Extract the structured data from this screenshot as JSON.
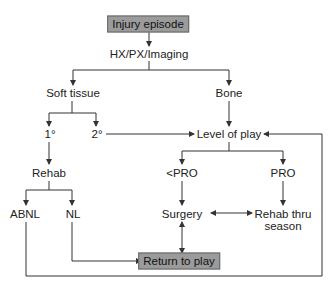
{
  "diagram": {
    "type": "flowchart",
    "colors": {
      "box_fill": "#9b9b9b",
      "box_border": "#666666",
      "line": "#333333",
      "text": "#222222",
      "background": "#ffffff"
    },
    "nodes": {
      "injury_episode": "Injury episode",
      "hx_px_imaging": "HX/PX/Imaging",
      "soft_tissue": "Soft tissue",
      "bone": "Bone",
      "primary": "1°",
      "secondary": "2°",
      "level_of_play": "Level of play",
      "rehab": "Rehab",
      "less_than_pro": "<PRO",
      "pro": "PRO",
      "abnl": "ABNL",
      "nl": "NL",
      "surgery": "Surgery",
      "rehab_thru_season": "Rehab thru season",
      "return_to_play": "Return to play"
    },
    "edges": [
      [
        "Injury episode",
        "HX/PX/Imaging"
      ],
      [
        "HX/PX/Imaging",
        "Soft tissue"
      ],
      [
        "HX/PX/Imaging",
        "Bone"
      ],
      [
        "Soft tissue",
        "1°"
      ],
      [
        "Soft tissue",
        "2°"
      ],
      [
        "2°",
        "Level of play"
      ],
      [
        "Bone",
        "Level of play"
      ],
      [
        "1°",
        "Rehab"
      ],
      [
        "Rehab",
        "ABNL"
      ],
      [
        "Rehab",
        "NL"
      ],
      [
        "Level of play",
        "<PRO"
      ],
      [
        "Level of play",
        "PRO"
      ],
      [
        "<PRO",
        "Surgery"
      ],
      [
        "PRO",
        "Rehab thru season"
      ],
      [
        "Surgery",
        "Rehab thru season",
        "bidirectional"
      ],
      [
        "Surgery",
        "Return to play",
        "bidirectional"
      ],
      [
        "NL",
        "Return to play"
      ],
      [
        "ABNL",
        "Level of play"
      ]
    ]
  }
}
